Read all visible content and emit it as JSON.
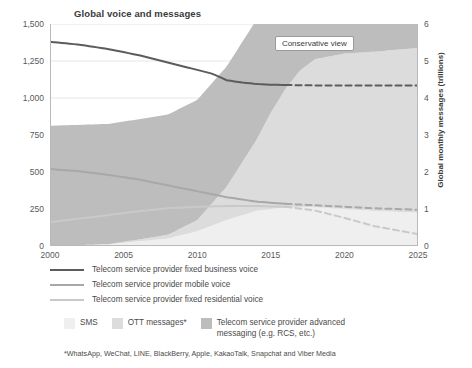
{
  "chart_data": {
    "type": "area",
    "title": "Global voice and messages",
    "xlabel": "",
    "ylabel": "Telco voice minutes/month per subscription",
    "ylabel_right": "Global monthly messages (trillions)",
    "xlim": [
      2000,
      2025
    ],
    "ylim_left": [
      0,
      1500
    ],
    "ylim_right": [
      0,
      6
    ],
    "grid": true,
    "legend_position": "below",
    "x_ticks": [
      "2000",
      "2005",
      "2010",
      "2015",
      "2020",
      "2025"
    ],
    "y_ticks_left": [
      "0",
      "250",
      "500",
      "750",
      "1,000",
      "1,250",
      "1,500"
    ],
    "y_ticks_right": [
      "0",
      "1",
      "2",
      "3",
      "4",
      "5",
      "6"
    ],
    "annotation": "Conservative view",
    "annotation_x": 2016.5,
    "series": [
      {
        "name": "Telecom service provider fixed business voice",
        "kind": "line",
        "color": "#5c5c5c",
        "axis": "left",
        "x": [
          2000,
          2002,
          2004,
          2006,
          2008,
          2010,
          2011,
          2012,
          2013,
          2014,
          2015,
          2016,
          2018,
          2020,
          2022,
          2025
        ],
        "values": [
          1380,
          1360,
          1330,
          1290,
          1240,
          1190,
          1165,
          1120,
          1105,
          1095,
          1090,
          1088,
          1085,
          1085,
          1085,
          1085
        ],
        "dashed_from": 2016
      },
      {
        "name": "Telecom service provider mobile voice",
        "kind": "line",
        "color": "#a8a8a8",
        "axis": "left",
        "x": [
          2000,
          2002,
          2004,
          2006,
          2008,
          2010,
          2012,
          2014,
          2016,
          2018,
          2020,
          2022,
          2025
        ],
        "values": [
          520,
          505,
          480,
          450,
          410,
          370,
          330,
          300,
          285,
          275,
          265,
          255,
          245
        ],
        "dashed_from": 2016
      },
      {
        "name": "Telecom service provider fixed residential voice",
        "kind": "line",
        "color": "#c9c9c9",
        "axis": "left",
        "x": [
          2000,
          2002,
          2004,
          2006,
          2008,
          2010,
          2012,
          2014,
          2016,
          2018,
          2020,
          2022,
          2025
        ],
        "values": [
          160,
          185,
          210,
          235,
          255,
          265,
          270,
          270,
          265,
          240,
          190,
          135,
          80
        ],
        "dashed_from": 2016
      },
      {
        "name": "SMS",
        "kind": "area",
        "color": "#efefef",
        "axis": "right",
        "x": [
          2000,
          2004,
          2008,
          2010,
          2012,
          2014,
          2016,
          2018,
          2020,
          2022,
          2025
        ],
        "values": [
          0.0,
          0.05,
          0.2,
          0.4,
          0.7,
          0.95,
          1.05,
          1.05,
          1.0,
          0.95,
          0.9
        ]
      },
      {
        "name": "OTT messages*",
        "kind": "area",
        "color": "#dcdcdc",
        "axis": "right",
        "x": [
          2000,
          2004,
          2008,
          2010,
          2012,
          2014,
          2015,
          2016,
          2017,
          2018,
          2020,
          2022,
          2025
        ],
        "values": [
          0.0,
          0.0,
          0.1,
          0.3,
          0.9,
          1.9,
          2.6,
          3.2,
          3.7,
          4.0,
          4.2,
          4.3,
          4.45
        ]
      },
      {
        "name": "Telecom service provider advanced messaging (e.g. RCS, etc.)",
        "kind": "area",
        "color": "#bdbdbd",
        "axis": "right",
        "x": [
          2016,
          2017,
          2018,
          2019,
          2020,
          2021,
          2022,
          2023,
          2024,
          2025
        ],
        "values": [
          3.25,
          3.8,
          4.15,
          4.35,
          4.5,
          4.65,
          4.8,
          5.0,
          5.2,
          5.45
        ]
      }
    ],
    "legend_lines": [
      {
        "label": "Telecom service provider fixed business voice",
        "color": "#5c5c5c"
      },
      {
        "label": "Telecom service provider mobile voice",
        "color": "#a8a8a8"
      },
      {
        "label": "Telecom service provider fixed residential voice",
        "color": "#c9c9c9"
      }
    ],
    "legend_areas": [
      {
        "label": "SMS",
        "color": "#efefef"
      },
      {
        "label": "OTT messages*",
        "color": "#dcdcdc"
      },
      {
        "label": "Telecom service provider advanced messaging (e.g. RCS, etc.)",
        "color": "#bdbdbd"
      }
    ],
    "footnote": "*WhatsApp, WeChat, LINE, BlackBerry, Apple, KakaoTalk, Snapchat and Viber Media"
  }
}
